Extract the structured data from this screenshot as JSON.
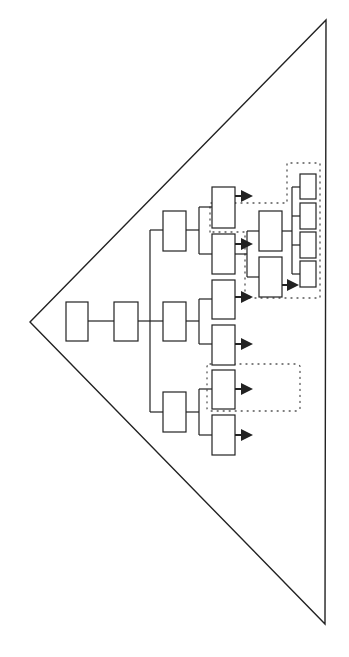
{
  "diagram": {
    "type": "hierarchy-tree-in-triangle",
    "colors": {
      "stroke": "#222222",
      "background": "#ffffff",
      "dotted": "#555555"
    },
    "triangle": {
      "points": [
        [
          30,
          322
        ],
        [
          326,
          20
        ],
        [
          325,
          624
        ]
      ]
    },
    "boxes": [
      {
        "id": "root",
        "x": 66,
        "y": 302,
        "w": 22,
        "h": 39
      },
      {
        "id": "level1",
        "x": 114,
        "y": 302,
        "w": 24,
        "h": 39
      },
      {
        "id": "level2-top",
        "x": 163,
        "y": 211,
        "w": 23,
        "h": 40
      },
      {
        "id": "level2-mid",
        "x": 163,
        "y": 302,
        "w": 23,
        "h": 39
      },
      {
        "id": "level2-bottom",
        "x": 163,
        "y": 392,
        "w": 23,
        "h": 40
      },
      {
        "id": "level3-1",
        "x": 212,
        "y": 187,
        "w": 23,
        "h": 41
      },
      {
        "id": "level3-2",
        "x": 212,
        "y": 234,
        "w": 23,
        "h": 40
      },
      {
        "id": "level3-3",
        "x": 212,
        "y": 280,
        "w": 23,
        "h": 39
      },
      {
        "id": "level3-4",
        "x": 212,
        "y": 325,
        "w": 23,
        "h": 40
      },
      {
        "id": "level3-5",
        "x": 212,
        "y": 370,
        "w": 23,
        "h": 39
      },
      {
        "id": "level3-6",
        "x": 212,
        "y": 415,
        "w": 23,
        "h": 40
      },
      {
        "id": "sub-1",
        "x": 259,
        "y": 211,
        "w": 23,
        "h": 40
      },
      {
        "id": "sub-2",
        "x": 259,
        "y": 257,
        "w": 23,
        "h": 40
      },
      {
        "id": "leaf-1",
        "x": 300,
        "y": 174,
        "w": 16,
        "h": 25
      },
      {
        "id": "leaf-2",
        "x": 300,
        "y": 203,
        "w": 16,
        "h": 26
      },
      {
        "id": "leaf-3",
        "x": 300,
        "y": 232,
        "w": 16,
        "h": 26
      },
      {
        "id": "leaf-4",
        "x": 300,
        "y": 261,
        "w": 16,
        "h": 26
      }
    ],
    "arrows": [
      {
        "from": "level3-1",
        "x1": 235,
        "y": 196,
        "x2": 251
      },
      {
        "from": "level3-2",
        "x1": 235,
        "y": 244,
        "x2": 251
      },
      {
        "from": "level3-3",
        "x1": 235,
        "y": 297,
        "x2": 251
      },
      {
        "from": "level3-4",
        "x1": 235,
        "y": 344,
        "x2": 251
      },
      {
        "from": "level3-5",
        "x1": 235,
        "y": 389,
        "x2": 251
      },
      {
        "from": "level3-6",
        "x1": 235,
        "y": 435,
        "x2": 251
      },
      {
        "from": "sub-2",
        "x1": 282,
        "y": 285,
        "x2": 297
      }
    ],
    "dotted_regions": [
      {
        "id": "group-upper",
        "points": [
          [
            210,
            232
          ],
          [
            210,
            203
          ],
          [
            287,
            203
          ],
          [
            287,
            163
          ],
          [
            320,
            163
          ],
          [
            320,
            298
          ],
          [
            245,
            298
          ],
          [
            245,
            232
          ]
        ]
      },
      {
        "id": "group-lower",
        "x": 207,
        "y": 364,
        "w": 93,
        "h": 47
      }
    ]
  }
}
